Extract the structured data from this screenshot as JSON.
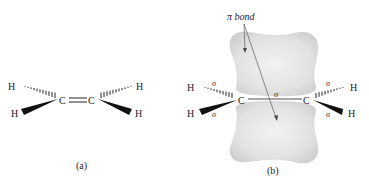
{
  "panel_a": {
    "caption": "(a)",
    "atoms": {
      "h_top_left": "H",
      "h_bottom_left": "H",
      "c_left": "C",
      "c_right": "C",
      "h_top_right": "H",
      "h_bottom_right": "H"
    }
  },
  "panel_b": {
    "caption": "(b)",
    "pi_label": "π bond",
    "atoms": {
      "h_top_left": "H",
      "h_bottom_left": "H",
      "c_left": "C",
      "c_right": "C",
      "h_top_right": "H",
      "h_bottom_right": "H"
    },
    "sigma_labels": {
      "top_left": "σ",
      "bottom_left": "σ",
      "cc": "σ",
      "top_right": "σ",
      "bottom_right": "σ"
    }
  }
}
